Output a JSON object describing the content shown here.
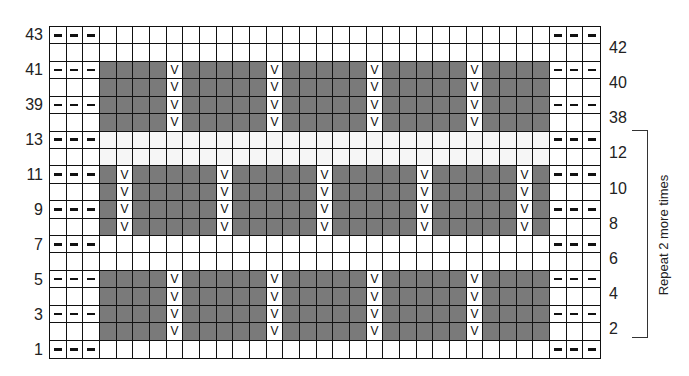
{
  "chart_data": {
    "type": "knitting-chart",
    "columns": 33,
    "rows_displayed": [
      43,
      42,
      41,
      40,
      39,
      38,
      13,
      12,
      11,
      10,
      9,
      8,
      7,
      6,
      5,
      4,
      3,
      2,
      1
    ],
    "left_row_labels": [
      "43",
      "41",
      "39",
      "13",
      "11",
      "9",
      "7",
      "5",
      "3",
      "1"
    ],
    "right_row_labels": [
      "42",
      "40",
      "38",
      "12",
      "10",
      "8",
      "6",
      "4",
      "2"
    ],
    "symbols": {
      "dash": "purl (–) on odd rows, edge columns 1-3 and 31-33",
      "v": "slip stitch (V)",
      "gray": "contrast color"
    },
    "bands": [
      {
        "rows": [
          41,
          40,
          39,
          38
        ],
        "gray_cols": [
          4,
          30
        ],
        "v_cols": [
          8,
          14,
          20,
          26
        ]
      },
      {
        "rows": [
          11,
          10,
          9,
          8
        ],
        "gray_cols": [
          4,
          30
        ],
        "v_cols": [
          5,
          11,
          17,
          23,
          29
        ]
      },
      {
        "rows": [
          5,
          4,
          3,
          2
        ],
        "gray_cols": [
          4,
          30
        ],
        "v_cols": [
          8,
          14,
          20,
          26
        ]
      }
    ],
    "dash_rows": [
      43,
      41,
      39,
      13,
      11,
      9,
      7,
      5,
      3,
      1
    ],
    "annotation": "Repeat 2 more times",
    "annotation_span_rows": [
      12,
      2
    ]
  },
  "labels": {
    "repeat_note": "Repeat 2 more times",
    "dash_symbol": "–",
    "slip_symbol": "V"
  },
  "colors": {
    "gray": "#7a7a7a",
    "grid": "#111111"
  }
}
